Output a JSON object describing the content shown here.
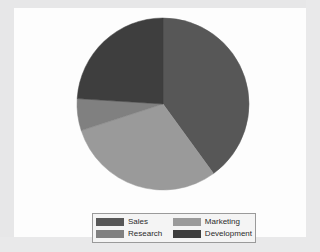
{
  "chart_data": {
    "type": "pie",
    "title": "",
    "categories": [
      "Sales",
      "Marketing",
      "Research",
      "Development"
    ],
    "values": [
      40,
      30,
      6,
      24
    ],
    "unit": "percent",
    "colors": [
      "#575757",
      "#9a9a9a",
      "#808080",
      "#3e3e3e"
    ],
    "start_angle_deg": 0,
    "direction": "clockwise",
    "slice_boundaries_deg": [
      0,
      145,
      252,
      274,
      360
    ],
    "labels_shown": false,
    "legend": {
      "position": "bottom",
      "columns": 2,
      "entries": [
        {
          "label": "Sales",
          "color": "#575757"
        },
        {
          "label": "Marketing",
          "color": "#9a9a9a"
        },
        {
          "label": "Research",
          "color": "#808080"
        },
        {
          "label": "Development",
          "color": "#3e3e3e"
        }
      ]
    }
  },
  "panel": {
    "background": "#fdfdfd"
  },
  "page": {
    "background": "#ececed"
  }
}
